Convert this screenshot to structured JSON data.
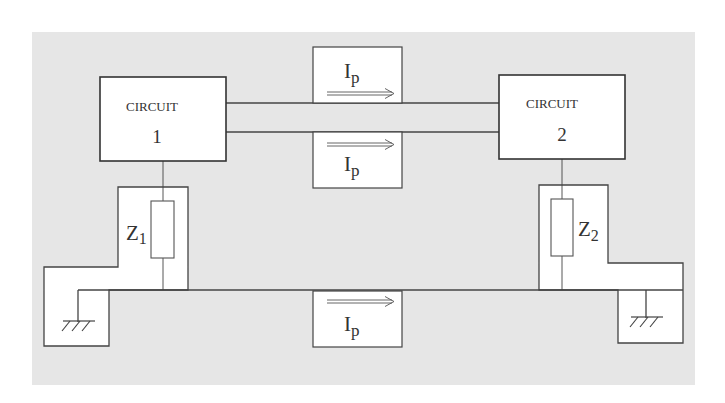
{
  "colors": {
    "background": "#e6e6e6",
    "line": "#444444",
    "box_fill": "#ffffff",
    "text": "#333333"
  },
  "circuit1": {
    "title": "CIRCUIT",
    "number": "1"
  },
  "circuit2": {
    "title": "CIRCUIT",
    "number": "2"
  },
  "impedance1": {
    "label": "Z",
    "subscript": "1"
  },
  "impedance2": {
    "label": "Z",
    "subscript": "2"
  },
  "current_top": {
    "label": "I",
    "subscript": "p",
    "direction": "right"
  },
  "current_middle": {
    "label": "I",
    "subscript": "p",
    "direction": "right"
  },
  "current_bottom": {
    "label": "I",
    "subscript": "p",
    "direction": "right"
  },
  "ground_left": {
    "symbol": "ground-icon"
  },
  "ground_right": {
    "symbol": "ground-icon"
  }
}
